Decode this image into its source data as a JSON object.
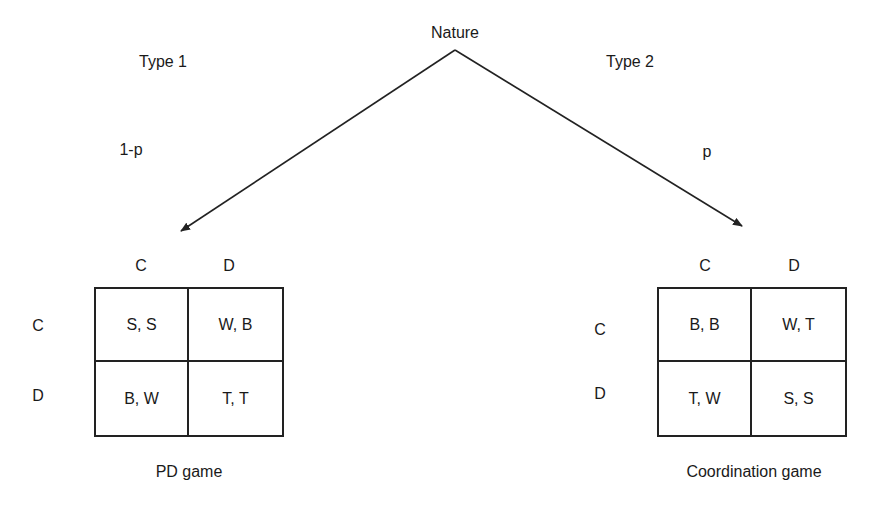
{
  "root": {
    "label": "Nature"
  },
  "branches": [
    {
      "type_label": "Type 1",
      "probability": "1-p"
    },
    {
      "type_label": "Type 2",
      "probability": "p"
    }
  ],
  "games": [
    {
      "title": "PD game",
      "col_headers": [
        "C",
        "D"
      ],
      "row_headers": [
        "C",
        "D"
      ],
      "payoffs": [
        [
          "S, S",
          "W, B"
        ],
        [
          "B, W",
          "T, T"
        ]
      ]
    },
    {
      "title": "Coordination game",
      "col_headers": [
        "C",
        "D"
      ],
      "row_headers": [
        "C",
        "D"
      ],
      "payoffs": [
        [
          "B, B",
          "W, T"
        ],
        [
          "T, W",
          "S, S"
        ]
      ]
    }
  ],
  "colors": {
    "line": "#222222",
    "text": "#1a1a1a",
    "background": "#ffffff"
  }
}
